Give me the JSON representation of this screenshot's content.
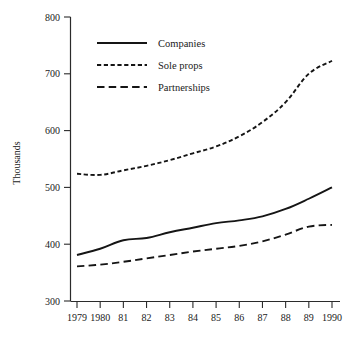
{
  "chart_data": {
    "type": "line",
    "title": "",
    "xlabel": "",
    "ylabel": "Thousands",
    "ylim": [
      300,
      800
    ],
    "yticks": [
      300,
      400,
      500,
      600,
      700,
      800
    ],
    "ytick_labels": [
      "300",
      "400",
      "500",
      "600",
      "700",
      "800"
    ],
    "grid": false,
    "legend_position": "top-left-inside",
    "categories": [
      "1979",
      "1980",
      "81",
      "82",
      "83",
      "84",
      "85",
      "86",
      "87",
      "88",
      "89",
      "1990"
    ],
    "x": [
      1979,
      1980,
      1981,
      1982,
      1983,
      1984,
      1985,
      1986,
      1987,
      1988,
      1989,
      1990
    ],
    "series": [
      {
        "name": "Companies",
        "style": "solid",
        "values": [
          381,
          392,
          407,
          411,
          421,
          429,
          437,
          442,
          449,
          462,
          480,
          500
        ]
      },
      {
        "name": "Sole props",
        "style": "dotted",
        "values": [
          524,
          522,
          530,
          538,
          548,
          560,
          572,
          590,
          615,
          650,
          700,
          723
        ]
      },
      {
        "name": "Partnerships",
        "style": "dashed",
        "values": [
          361,
          364,
          369,
          375,
          381,
          387,
          392,
          397,
          405,
          417,
          431,
          434
        ]
      }
    ]
  },
  "legend": {
    "items": [
      {
        "label": "Companies",
        "style": "solid"
      },
      {
        "label": "Sole props",
        "style": "dotted"
      },
      {
        "label": "Partnerships",
        "style": "dashed"
      }
    ]
  },
  "axes": {
    "y_title": "Thousands"
  }
}
